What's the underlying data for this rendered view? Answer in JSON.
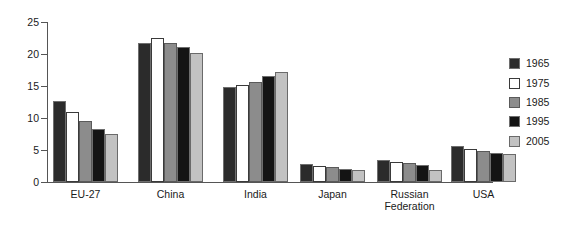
{
  "chart_data": {
    "type": "bar",
    "title": "",
    "subtitle": "",
    "xlabel": "",
    "ylabel": "",
    "ylim": [
      0,
      25
    ],
    "ytick_labels": [
      "0",
      "5",
      "10",
      "15",
      "20",
      "25"
    ],
    "yticks": [
      0,
      5,
      10,
      15,
      20,
      25
    ],
    "grid": false,
    "legend_position": "right",
    "categories": [
      "EU-27",
      "China",
      "India",
      "Japan",
      "Russian\nFederation",
      "USA"
    ],
    "series": [
      {
        "name": "1965",
        "color": "#2b2b2b",
        "values": [
          12.6,
          21.7,
          14.8,
          2.8,
          3.5,
          5.6
        ]
      },
      {
        "name": "1975",
        "color": "#ffffff",
        "values": [
          11.0,
          22.5,
          15.1,
          2.5,
          3.1,
          5.2
        ]
      },
      {
        "name": "1985",
        "color": "#8c8c8c",
        "values": [
          9.6,
          21.7,
          15.7,
          2.3,
          2.9,
          4.8
        ]
      },
      {
        "name": "1995",
        "color": "#141414",
        "values": [
          8.3,
          21.1,
          16.5,
          2.0,
          2.6,
          4.5
        ]
      },
      {
        "name": "2005",
        "color": "#c2c2c2",
        "values": [
          7.5,
          20.1,
          17.2,
          1.9,
          1.9,
          4.3
        ]
      }
    ]
  },
  "legend": {
    "entries": [
      {
        "label": "1965"
      },
      {
        "label": "1975"
      },
      {
        "label": "1985"
      },
      {
        "label": "1995"
      },
      {
        "label": "2005"
      }
    ]
  }
}
